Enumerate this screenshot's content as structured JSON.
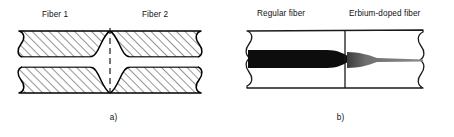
{
  "figure": {
    "panels": [
      {
        "id": "a",
        "caption": "a)",
        "labels": [
          {
            "name": "fiber-1",
            "text": "Fiber 1"
          },
          {
            "name": "fiber-2",
            "text": "Fiber 2"
          }
        ],
        "elements": {
          "cladding": "hatched-cladding",
          "core": "white-core-band",
          "splice": "dashed-splice-centerline",
          "bulge": "fusion-splice-bulge",
          "break_left": "wavy-break-line-left",
          "break_right": "wavy-break-line-right"
        },
        "colors": {
          "outline": "#000000",
          "hatch": "#3a3a3a",
          "cladding_fill": "#ffffff",
          "core_fill": "#ffffff",
          "splice_line": "#1a1a1a"
        }
      },
      {
        "id": "b",
        "caption": "b)",
        "labels": [
          {
            "name": "regular-fiber",
            "text": "Regular fiber"
          },
          {
            "name": "erbium-doped-fiber",
            "text": "Erbium-doped fiber"
          }
        ],
        "elements": {
          "cladding": "plain-white-cladding",
          "core_left": "thick-black-core",
          "core_right": "tapered-grey-core",
          "splice": "solid-splice-line",
          "break_left": "wavy-break-line-left",
          "break_right": "wavy-break-line-right"
        },
        "colors": {
          "outline": "#000000",
          "cladding_fill": "#ffffff",
          "core_dark": "#0d0d0d",
          "core_grey": "#808080",
          "splice_line": "#1a1a1a"
        }
      }
    ]
  }
}
